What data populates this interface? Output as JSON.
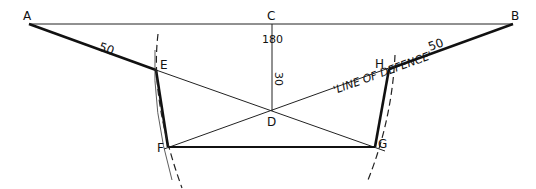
{
  "diagram": {
    "points": {
      "A": {
        "label": "A",
        "x": 29,
        "y": 24
      },
      "C": {
        "label": "C",
        "x": 272,
        "y": 24
      },
      "B": {
        "label": "B",
        "x": 513,
        "y": 24
      },
      "E": {
        "label": "E",
        "x": 156,
        "y": 70
      },
      "H": {
        "label": "H",
        "x": 389,
        "y": 69
      },
      "D": {
        "label": "D",
        "x": 272,
        "y": 111
      },
      "F": {
        "label": "F",
        "x": 168,
        "y": 147
      },
      "G": {
        "label": "G",
        "x": 375,
        "y": 147
      }
    },
    "dimensions": {
      "AE": "50",
      "HB": "50",
      "CD_outer": "180",
      "CD_inner": "30"
    },
    "annotation": "'LINE OF DEFENCE'",
    "colors": {
      "ink": "#111111",
      "background": "#ffffff"
    }
  }
}
